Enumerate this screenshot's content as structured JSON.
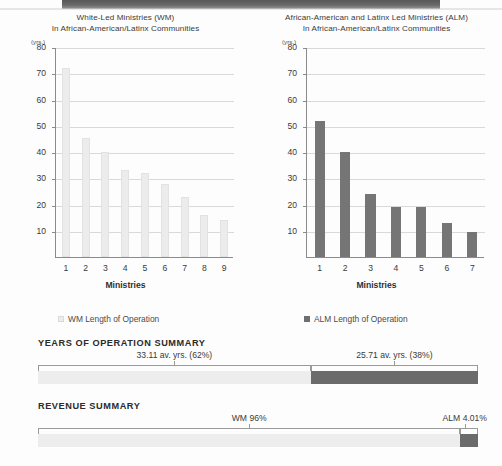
{
  "chart_data": [
    {
      "type": "bar",
      "title": "White-Led Ministries (WM)",
      "subtitle": "In African-American/Latinx Communities",
      "xlabel": "Ministries",
      "ylabel": "(yrs.)",
      "unit": "(yrs.)",
      "categories": [
        "1",
        "2",
        "3",
        "4",
        "5",
        "6",
        "7",
        "8",
        "9"
      ],
      "values": [
        72,
        45.5,
        40,
        33,
        32,
        28,
        23,
        16,
        14
      ],
      "ylim": [
        0,
        80
      ],
      "yticks": [
        "10",
        "20",
        "30",
        "40",
        "50",
        "60",
        "70",
        "80"
      ],
      "grid": true,
      "legend": "WM Length of Operation",
      "legend_position": "below",
      "bar_color": "#ececec"
    },
    {
      "type": "bar",
      "title": "African-American and Latinx Led Ministries (ALM)",
      "subtitle": "In African-American/Latinx Communities",
      "xlabel": "Ministries",
      "ylabel": "(yrs.)",
      "unit": "(yrs.)",
      "categories": [
        "1",
        "2",
        "3",
        "4",
        "5",
        "6",
        "7"
      ],
      "values": [
        52,
        40,
        24,
        19,
        19,
        13,
        9.5
      ],
      "ylim": [
        0,
        80
      ],
      "yticks": [
        "10",
        "20",
        "30",
        "40",
        "50",
        "60",
        "70",
        "80"
      ],
      "grid": true,
      "legend": "ALM Length of Operation",
      "legend_position": "below",
      "bar_color": "#757575"
    },
    {
      "type": "bar",
      "orientation": "stacked-horizontal",
      "title": "YEARS OF OPERATION SUMMARY",
      "categories": [
        "WM",
        "ALM"
      ],
      "values": [
        62,
        38
      ],
      "labels": [
        "33.11 av. yrs. (62%)",
        "25.71 av. yrs. (38%)"
      ],
      "colors": [
        "#ededed",
        "#6b6b6b"
      ]
    },
    {
      "type": "bar",
      "orientation": "stacked-horizontal",
      "title": "REVENUE SUMMARY",
      "categories": [
        "WM",
        "ALM"
      ],
      "values": [
        96,
        4.01
      ],
      "labels": [
        "WM 96%",
        "ALM 4.01%"
      ],
      "colors": [
        "#ededed",
        "#6b6b6b"
      ]
    }
  ],
  "charts": {
    "wm": {
      "title_line1": "White-Led Ministries (WM)",
      "title_line2": "In African-American/Latinx Communities",
      "unit": "(yrs.)",
      "axis_title": "Ministries",
      "legend": "WM Length of Operation"
    },
    "alm": {
      "title_line1": "African-American and Latinx Led Ministries (ALM)",
      "title_line2": "In African-American/Latinx Communities",
      "unit": "(yrs.)",
      "axis_title": "Ministries",
      "legend": "ALM Length of Operation"
    }
  },
  "summaries": {
    "years": {
      "heading": "YEARS OF OPERATION SUMMARY",
      "left_value": "33.11 av. yrs. (62%)",
      "right_value": "25.71 av. yrs. (38%)"
    },
    "revenue": {
      "heading": "REVENUE SUMMARY",
      "left_value": "WM 96%",
      "right_value": "ALM 4.01%"
    }
  },
  "colors": {
    "wm_bar": "#ececec",
    "alm_bar": "#757575",
    "grid": "#d9d9d9",
    "axis": "#8b8b8b",
    "text": "#3a3a3a"
  }
}
